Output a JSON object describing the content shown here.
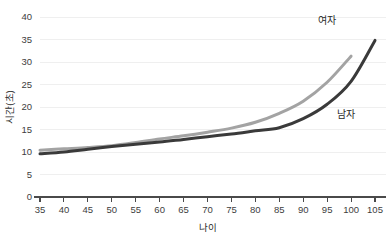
{
  "chart_data": {
    "type": "line",
    "title": "",
    "subtitle": "",
    "xlabel": "나이",
    "ylabel": "시간(초)",
    "xlim": [
      35,
      105
    ],
    "ylim": [
      0,
      40
    ],
    "x": [
      35,
      40,
      45,
      50,
      55,
      60,
      65,
      70,
      75,
      80,
      85,
      90,
      95,
      100,
      105
    ],
    "xticks": [
      "35",
      "40",
      "45",
      "50",
      "55",
      "60",
      "65",
      "70",
      "75",
      "80",
      "85",
      "90",
      "95",
      "100",
      "105"
    ],
    "yticks": [
      "0",
      "5",
      "10",
      "15",
      "20",
      "25",
      "30",
      "35",
      "40"
    ],
    "grid": "horizontal",
    "legend_position": "inline-annotation",
    "series": [
      {
        "name": "여자",
        "color": "#a3a3a3",
        "label_x": 95,
        "label_y": 38.5,
        "values": [
          10.4,
          10.7,
          11.0,
          11.4,
          12.1,
          12.9,
          13.6,
          14.4,
          15.3,
          16.6,
          18.6,
          21.3,
          25.5,
          31.3,
          null
        ]
      },
      {
        "name": "남자",
        "color": "#3a3a3a",
        "label_x": 99,
        "label_y": 17.5,
        "values": [
          9.6,
          10.0,
          10.6,
          11.2,
          11.7,
          12.2,
          12.8,
          13.4,
          14.0,
          14.7,
          15.4,
          17.4,
          20.6,
          25.7,
          34.8
        ]
      }
    ]
  },
  "axis": {
    "x_title": "나이",
    "y_title": "시간(초)"
  }
}
